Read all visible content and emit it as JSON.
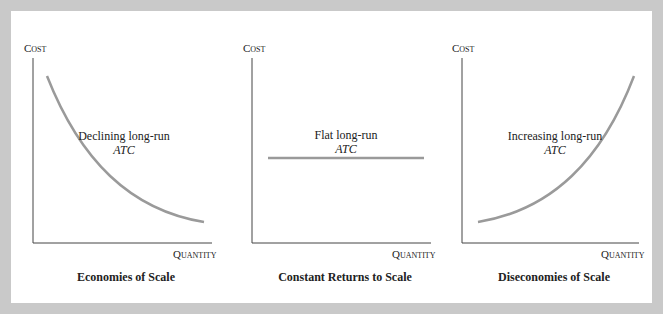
{
  "panels": [
    {
      "y_label": "Cost",
      "x_label": "Quantity",
      "curve_label": "Declining long-run",
      "curve_label_italic": "ATC",
      "title": "Economies of Scale"
    },
    {
      "y_label": "Cost",
      "x_label": "Quantity",
      "curve_label": "Flat long-run",
      "curve_label_italic": "ATC",
      "title": "Constant Returns to Scale"
    },
    {
      "y_label": "Cost",
      "x_label": "Quantity",
      "curve_label": "Increasing long-run",
      "curve_label_italic": "ATC",
      "title": "Diseconomies of Scale"
    }
  ],
  "colors": {
    "frame": "#c9c9c9",
    "curve": "#9a9a9a",
    "axis": "#444444"
  }
}
